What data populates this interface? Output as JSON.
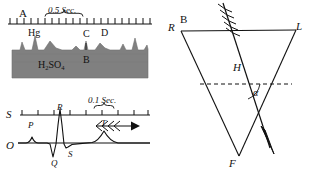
{
  "figure": {
    "background_color": "#ffffff",
    "ink_color": "#111111",
    "electrolyte_fill_color": "#808080",
    "panels": [
      "A",
      "S",
      "B"
    ]
  },
  "panel_a": {
    "name": "capillary-electrometer-trace",
    "panel_label": "A",
    "scale_label": "0.5 Sec.",
    "axis": {
      "name": "time-axis",
      "tick_count": 21,
      "brace_span_ticks": 5
    },
    "medium_label_main": "H",
    "medium_label_sub1": "2",
    "medium_label_mid": "SO",
    "medium_label_sub2": "4",
    "medium_label_full": "H2SO4",
    "mercury_label": "Hg",
    "wave_labels": [
      {
        "text": "Hg",
        "x": 33,
        "y": 33
      },
      {
        "text": "C",
        "x": 86,
        "y": 33
      },
      {
        "text": "D",
        "x": 104,
        "y": 31
      },
      {
        "text": "B",
        "x": 86,
        "y": 59
      }
    ]
  },
  "panel_s": {
    "name": "electrocardiogram-trace",
    "panel_label": "S",
    "baseline_label": "O",
    "scale_label": "0.1 Sec.",
    "axis": {
      "name": "time-axis",
      "tick_count": 9,
      "brace_span_ticks": 1
    },
    "arrow": {
      "name": "feathered-arrow",
      "direction": "right",
      "feather_count": 4
    },
    "wave_labels": [
      {
        "text": "P",
        "x": 30,
        "y": 29
      },
      {
        "text": "R",
        "x": 59,
        "y": 17
      },
      {
        "text": "Q",
        "x": 55,
        "y": 62
      },
      {
        "text": "S",
        "x": 70,
        "y": 54
      },
      {
        "text": "T",
        "x": 103,
        "y": 27
      }
    ]
  },
  "panel_b": {
    "name": "einthoven-triangle-diagram",
    "panel_label": "B",
    "vertex_labels": {
      "right": "R",
      "left": "L",
      "foot": "F"
    },
    "axis_label": "H",
    "angle_label": "α",
    "arrow": {
      "name": "electrical-axis-vector-arrow",
      "direction": "down-right",
      "feather_count": 5
    },
    "horizontal_reference": {
      "name": "horizontal-dashed-reference-line",
      "style": "dashed"
    }
  }
}
